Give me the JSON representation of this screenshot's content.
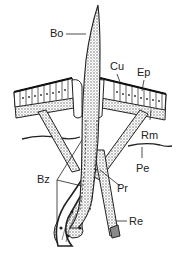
{
  "diagram": {
    "labels": {
      "bo": "Bo",
      "cu": "Cu",
      "ep": "Ep",
      "rm": "Rm",
      "pe": "Pe",
      "bz": "Bz",
      "pr": "Pr",
      "re": "Re"
    },
    "colors": {
      "ink": "#222222",
      "stipple": "#9a9a9a",
      "background": "#ffffff"
    }
  }
}
